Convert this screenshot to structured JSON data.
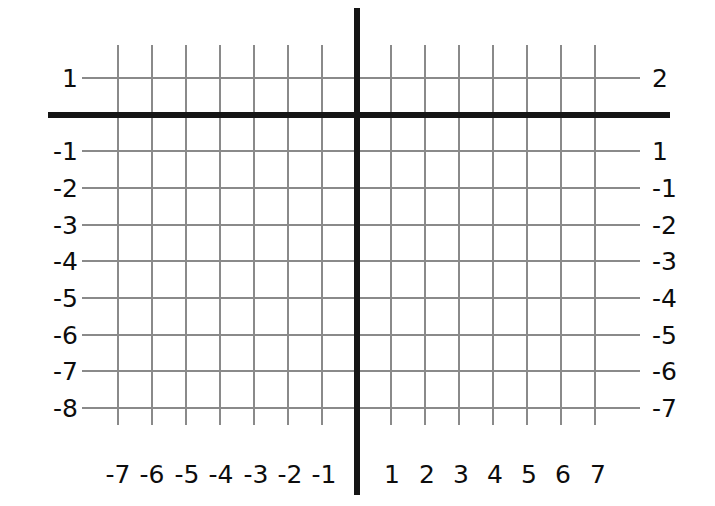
{
  "figure": {
    "kind": "coordinate-grid",
    "background_color": "#ffffff",
    "grid_line_color": "#8a8a8a",
    "axis_color": "#151515",
    "label_color": "#0d0d0d"
  },
  "chart_data": {
    "type": "scatter",
    "title": "",
    "subtitle": "",
    "xlabel": "",
    "ylabel": "",
    "grid": true,
    "legend": null,
    "annotations": [],
    "series": [],
    "x": [],
    "values": [],
    "xlim": [
      -8,
      8
    ],
    "ylim": [
      -9,
      2
    ],
    "x_tick_labels": [
      "-7",
      "-6",
      "-5",
      "-4",
      "-3",
      "-2",
      "-1",
      "1",
      "2",
      "3",
      "4",
      "5",
      "6",
      "7"
    ],
    "y_tick_labels_left": [
      "1",
      "-1",
      "-2",
      "-3",
      "-4",
      "-5",
      "-6",
      "-7",
      "-8"
    ],
    "y_tick_labels_right": [
      "2",
      "1",
      "-1",
      "-2",
      "-3",
      "-4",
      "-5",
      "-6",
      "-7"
    ]
  },
  "axes": {
    "x_axis": {
      "name": "x-axis",
      "y_px": 115,
      "x_start_px": 48,
      "x_end_px": 670,
      "thickness_px": 6
    },
    "y_axis": {
      "name": "y-axis",
      "x_px": 357,
      "y_start_px": 8,
      "y_end_px": 495,
      "thickness_px": 6
    }
  },
  "gridlines": {
    "vertical_x_px": [
      118,
      152,
      186,
      220,
      254,
      288,
      322,
      391,
      425,
      459,
      493,
      527,
      561,
      595
    ],
    "vertical_y_top_px": 45,
    "vertical_y_bottom_px": 425,
    "horizontal_y_px": [
      78,
      151,
      188,
      225,
      261,
      298,
      335,
      371,
      408
    ],
    "horizontal_x_left_px": 82,
    "horizontal_x_right_px": 640
  },
  "y_labels_left": [
    {
      "text": "1",
      "y_px": 78
    },
    {
      "text": "-1",
      "y_px": 151
    },
    {
      "text": "-2",
      "y_px": 188
    },
    {
      "text": "-3",
      "y_px": 225
    },
    {
      "text": "-4",
      "y_px": 261
    },
    {
      "text": "-5",
      "y_px": 298
    },
    {
      "text": "-6",
      "y_px": 335
    },
    {
      "text": "-7",
      "y_px": 371
    },
    {
      "text": "-8",
      "y_px": 408
    }
  ],
  "y_labels_right": [
    {
      "text": "2",
      "y_px": 78
    },
    {
      "text": "1",
      "y_px": 151
    },
    {
      "text": "-1",
      "y_px": 188
    },
    {
      "text": "-2",
      "y_px": 225
    },
    {
      "text": "-3",
      "y_px": 261
    },
    {
      "text": "-4",
      "y_px": 298
    },
    {
      "text": "-5",
      "y_px": 335
    },
    {
      "text": "-6",
      "y_px": 371
    },
    {
      "text": "-7",
      "y_px": 408
    }
  ],
  "x_labels": [
    {
      "text": "-7",
      "x_px": 118
    },
    {
      "text": "-6",
      "x_px": 152
    },
    {
      "text": "-5",
      "x_px": 187
    },
    {
      "text": "-4",
      "x_px": 221
    },
    {
      "text": "-3",
      "x_px": 256
    },
    {
      "text": "-2",
      "x_px": 290
    },
    {
      "text": "-1",
      "x_px": 324
    },
    {
      "text": "1",
      "x_px": 392
    },
    {
      "text": "2",
      "x_px": 427
    },
    {
      "text": "3",
      "x_px": 461
    },
    {
      "text": "4",
      "x_px": 495
    },
    {
      "text": "5",
      "x_px": 529
    },
    {
      "text": "6",
      "x_px": 563
    },
    {
      "text": "7",
      "x_px": 598
    }
  ],
  "x_labels_y_px": 462
}
